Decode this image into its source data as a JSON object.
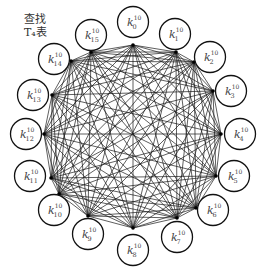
{
  "caption": {
    "line1": "查找",
    "line2": "T₄表"
  },
  "graph": {
    "type": "complete-graph",
    "node_count": 16,
    "edge_color": "#1a1a1a",
    "node_stroke": "#111111",
    "node_fill": "#ffffff",
    "nodes": [
      {
        "id": 0,
        "label": "k",
        "sub": "0",
        "sup": "10",
        "cx": 133,
        "cy": 22,
        "hx": 133,
        "hy": 45
      },
      {
        "id": 1,
        "label": "k",
        "sub": "1",
        "sup": "10",
        "cx": 175,
        "cy": 34,
        "hx": 176,
        "hy": 52
      },
      {
        "id": 2,
        "label": "k",
        "sub": "2",
        "sup": "10",
        "cx": 210,
        "cy": 57,
        "hx": 194,
        "hy": 62
      },
      {
        "id": 3,
        "label": "k",
        "sub": "3",
        "sup": "10",
        "cx": 231,
        "cy": 91,
        "hx": 213,
        "hy": 91
      },
      {
        "id": 4,
        "label": "k",
        "sub": "4",
        "sup": "10",
        "cx": 240,
        "cy": 134,
        "hx": 221,
        "hy": 134
      },
      {
        "id": 5,
        "label": "k",
        "sub": "5",
        "sup": "10",
        "cx": 234,
        "cy": 176,
        "hx": 216,
        "hy": 176
      },
      {
        "id": 6,
        "label": "k",
        "sub": "6",
        "sup": "10",
        "cx": 213,
        "cy": 210,
        "hx": 196,
        "hy": 208
      },
      {
        "id": 7,
        "label": "k",
        "sub": "7",
        "sup": "10",
        "cx": 177,
        "cy": 237,
        "hx": 177,
        "hy": 218
      },
      {
        "id": 8,
        "label": "k",
        "sub": "8",
        "sup": "10",
        "cx": 133,
        "cy": 250,
        "hx": 133,
        "hy": 228
      },
      {
        "id": 9,
        "label": "k",
        "sub": "9",
        "sup": "10",
        "cx": 88,
        "cy": 234,
        "hx": 88,
        "hy": 216
      },
      {
        "id": 10,
        "label": "k",
        "sub": "10",
        "sup": "10",
        "cx": 54,
        "cy": 210,
        "hx": 59,
        "hy": 194
      },
      {
        "id": 11,
        "label": "k",
        "sub": "11",
        "sup": "10",
        "cx": 30,
        "cy": 176,
        "hx": 51,
        "hy": 178
      },
      {
        "id": 12,
        "label": "k",
        "sub": "12",
        "sup": "10",
        "cx": 26,
        "cy": 134,
        "hx": 44,
        "hy": 134
      },
      {
        "id": 13,
        "label": "k",
        "sub": "13",
        "sup": "10",
        "cx": 33,
        "cy": 95,
        "hx": 52,
        "hy": 95
      },
      {
        "id": 14,
        "label": "k",
        "sub": "14",
        "sup": "10",
        "cx": 54,
        "cy": 59,
        "hx": 71,
        "hy": 61
      },
      {
        "id": 15,
        "label": "k",
        "sub": "15",
        "sup": "10",
        "cx": 91,
        "cy": 35,
        "hx": 91,
        "hy": 52
      }
    ]
  }
}
